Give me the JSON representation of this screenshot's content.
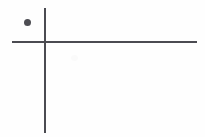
{
  "figure": {
    "title": "",
    "background_color": "#fefefe",
    "width": 205,
    "height": 137,
    "line_color": "#4b4b51",
    "point_color": "#4d4d53"
  },
  "axes": {
    "vertical": {
      "label": "",
      "name": "vertical-axis",
      "x": 45,
      "y_start": 8,
      "y_end": 133,
      "thickness": 1.6
    },
    "horizontal": {
      "label": "",
      "name": "horizontal-axis",
      "y": 42,
      "x_start": 12,
      "x_end": 197,
      "thickness": 1.6
    },
    "origin": {
      "x": 45,
      "y": 42
    }
  },
  "chart_data": {
    "type": "scatter",
    "title": "",
    "subtitle": "",
    "xlabel": "",
    "ylabel": "",
    "xlim": [
      12,
      197
    ],
    "ylim": [
      8,
      133
    ],
    "grid": false,
    "legend": [],
    "legend_position": "none",
    "origin_px": [
      45,
      42
    ],
    "annotations": [],
    "tick_labels": {
      "x": [],
      "y": []
    },
    "series": [
      {
        "name": "point",
        "marker": "filled-circle",
        "marker_size_px": 7,
        "color": "#4d4d53",
        "points_px": [
          {
            "x": 27,
            "y": 22
          }
        ],
        "points_axis": [
          {
            "x": -18,
            "y": 20,
            "quadrant": "upper-left"
          }
        ]
      }
    ]
  },
  "artifacts": {
    "smudge_label": "paper-smudge"
  }
}
